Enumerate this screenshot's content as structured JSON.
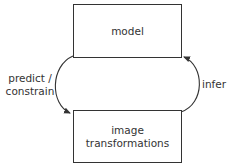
{
  "diagram": {
    "nodes": [
      {
        "id": "model",
        "label": "model"
      },
      {
        "id": "image_transformations",
        "label_lines": [
          "image",
          "transformations"
        ]
      }
    ],
    "edges": [
      {
        "from": "model",
        "to": "image_transformations",
        "label_lines": [
          "predict /",
          "constrain"
        ],
        "side": "left"
      },
      {
        "from": "image_transformations",
        "to": "model",
        "label": "infer",
        "side": "right"
      }
    ]
  }
}
